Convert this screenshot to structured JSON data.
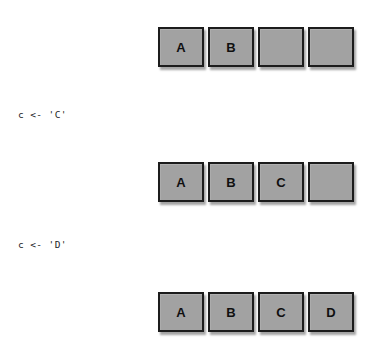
{
  "figure": {
    "background_color": "#ffffff",
    "cell_fill_color": "#a2a2a2",
    "cell_border_color": "#1c1c1c",
    "text_color": "#1d1d1d"
  },
  "rows": [
    {
      "name": "array-state-initial",
      "cells": [
        {
          "label": "A",
          "filled": true
        },
        {
          "label": "B",
          "filled": true
        },
        {
          "label": "",
          "filled": false
        },
        {
          "label": "",
          "filled": false
        }
      ]
    },
    {
      "name": "array-state-after-c",
      "cells": [
        {
          "label": "A",
          "filled": true
        },
        {
          "label": "B",
          "filled": true
        },
        {
          "label": "C",
          "filled": true
        },
        {
          "label": "",
          "filled": false
        }
      ]
    },
    {
      "name": "array-state-after-d",
      "cells": [
        {
          "label": "A",
          "filled": true
        },
        {
          "label": "B",
          "filled": true
        },
        {
          "label": "C",
          "filled": true
        },
        {
          "label": "D",
          "filled": true
        }
      ]
    }
  ],
  "code_lines": [
    {
      "text": "c <- 'C'"
    },
    {
      "text": "c <- 'D'"
    }
  ]
}
